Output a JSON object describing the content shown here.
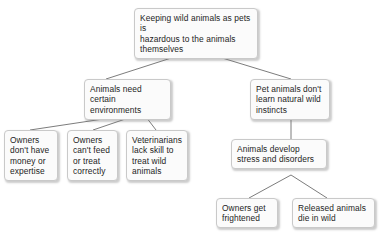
{
  "diagram": {
    "type": "concept-map",
    "orientation": "top-down",
    "nodes": [
      {
        "id": "root",
        "name": "node-root-claim",
        "text": "Keeping wild animals as pets is\nhazardous to the animals\nthemselves",
        "level": 0
      },
      {
        "id": "env",
        "name": "node-animals-need-environments",
        "text": "Animals need\ncertain environments",
        "level": 1
      },
      {
        "id": "instincts",
        "name": "node-pet-animals-instincts",
        "text": "Pet animals don't\nlearn natural wild\ninstincts",
        "level": 1
      },
      {
        "id": "money",
        "name": "node-owners-money-expertise",
        "text": "Owners\ndon't have\nmoney or\nexpertise",
        "level": 2
      },
      {
        "id": "feed",
        "name": "node-owners-cant-feed",
        "text": "Owners\ncan't feed\nor treat\ncorrectly",
        "level": 2
      },
      {
        "id": "vets",
        "name": "node-veterinarians-lack-skill",
        "text": "Veterinarians\nlack skill to\ntreat wild\nanimals",
        "level": 2
      },
      {
        "id": "stress",
        "name": "node-animals-develop-stress",
        "text": "Animals develop\nstress and disorders",
        "level": 2
      },
      {
        "id": "frightened",
        "name": "node-owners-get-frightened",
        "text": "Owners get\nfrightened",
        "level": 3
      },
      {
        "id": "released",
        "name": "node-released-animals-die",
        "text": "Released animals\ndie in wild",
        "level": 3
      }
    ],
    "edges": [
      {
        "from": "root",
        "to": "env"
      },
      {
        "from": "root",
        "to": "instincts"
      },
      {
        "from": "env",
        "to": "money"
      },
      {
        "from": "env",
        "to": "feed"
      },
      {
        "from": "env",
        "to": "vets"
      },
      {
        "from": "instincts",
        "to": "stress"
      },
      {
        "from": "stress",
        "to": "frightened"
      },
      {
        "from": "stress",
        "to": "released"
      }
    ],
    "style": {
      "node_fill": "#fbfbfb",
      "node_border": "#c9c9c9",
      "connector_color": "#6d6d6d",
      "text_color": "#1d1d1d",
      "background": "#ffffff"
    }
  }
}
